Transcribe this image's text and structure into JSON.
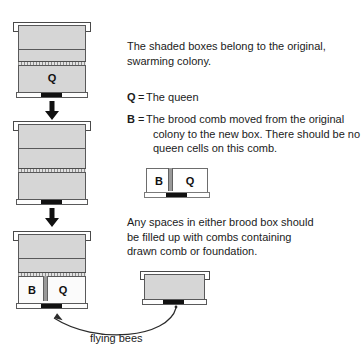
{
  "diagram": {
    "title_text": "",
    "notes": {
      "shaded_note_line1": "The shaded boxes belong to the original,",
      "shaded_note_line2": "swarming colony.",
      "spaces_note_line1": "Any spaces in either brood box should",
      "spaces_note_line2": "be filled up with combs containing",
      "spaces_note_line3": "drawn comb or foundation."
    },
    "legend": [
      {
        "key": "Q",
        "eq": "=",
        "lines": [
          "The queen"
        ]
      },
      {
        "key": "B",
        "eq": "=",
        "lines": [
          "The brood comb moved from the original",
          "colony to the new box. There should be no",
          "queen cells on this comb."
        ]
      }
    ],
    "hive_labels": {
      "queen": "Q",
      "brood": "B"
    },
    "mini_box": {
      "left_label": "B",
      "right_label": "Q"
    },
    "flying_bees_caption": "flying bees",
    "colors": {
      "shaded_fill": "#d6d6d6",
      "plain_fill": "#fbfbfb",
      "outline": "#59595a",
      "excluder": "#8d8d8d",
      "entrance": "#111111",
      "text": "#1b1b1b"
    }
  }
}
